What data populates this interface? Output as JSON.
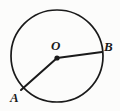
{
  "figure": {
    "background_color": "#fcfcfb",
    "stroke_color": "#1a1a1a",
    "labels": {
      "center": "O",
      "point_b": "B",
      "point_a": "A"
    }
  },
  "geometry": {
    "circle": {
      "center_x": 57,
      "center_y": 56,
      "radius": 46,
      "stroke_width": 1.7
    },
    "center_dot": {
      "x": 57,
      "y": 58,
      "radius": 2.6
    },
    "radii": [
      {
        "name": "OB",
        "from_x": 57,
        "from_y": 58,
        "to_x": 102,
        "to_y": 52,
        "stroke_width": 2.0
      },
      {
        "name": "OA",
        "from_x": 57,
        "from_y": 58,
        "to_x": 21,
        "to_y": 90,
        "stroke_width": 2.0
      }
    ]
  }
}
